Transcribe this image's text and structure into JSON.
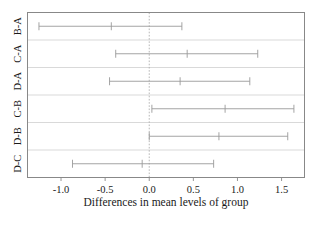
{
  "chart_data": {
    "type": "line",
    "title": "",
    "subtitle": "",
    "xlabel": "Differences in mean levels of group",
    "ylabel": "",
    "xlim": [
      -1.38,
      1.76
    ],
    "ylim": [
      0,
      6
    ],
    "grid": false,
    "legend": null,
    "reference_line": {
      "value": 0.0,
      "style": "dashed"
    },
    "orientation": "horizontal",
    "categories": [
      "B-A",
      "C-A",
      "D-A",
      "C-B",
      "D-B",
      "D-C"
    ],
    "series": [
      {
        "name": "difference",
        "values": [
          -0.43,
          0.43,
          0.35,
          0.86,
          0.79,
          -0.08
        ]
      },
      {
        "name": "lower",
        "values": [
          -1.25,
          -0.38,
          -0.45,
          0.03,
          0.0,
          -0.87
        ]
      },
      {
        "name": "upper",
        "values": [
          0.37,
          1.23,
          1.14,
          1.64,
          1.57,
          0.73
        ]
      }
    ],
    "intervals": [
      {
        "label": "B-A",
        "lower": -1.25,
        "diff": -0.43,
        "upper": 0.37
      },
      {
        "label": "C-A",
        "lower": -0.38,
        "diff": 0.43,
        "upper": 1.23
      },
      {
        "label": "D-A",
        "lower": -0.45,
        "diff": 0.35,
        "upper": 1.14
      },
      {
        "label": "C-B",
        "lower": 0.03,
        "diff": 0.86,
        "upper": 1.64
      },
      {
        "label": "D-B",
        "lower": 0.0,
        "diff": 0.79,
        "upper": 1.57
      },
      {
        "label": "D-C",
        "lower": -0.87,
        "diff": -0.08,
        "upper": 0.73
      }
    ],
    "xticks": [
      -1.0,
      -0.5,
      0.0,
      0.5,
      1.0,
      1.5
    ],
    "xticklabels": [
      "-1.0",
      "-0.5",
      "0.0",
      "0.5",
      "1.0",
      "1.5"
    ],
    "yticklabels": [
      "B-A",
      "C-A",
      "D-A",
      "C-B",
      "D-B",
      "D-C"
    ],
    "colors": {
      "line": "#9a9a9a",
      "frame": "#888888",
      "zero": "#b0b0b0",
      "text": "#1a1a1a"
    }
  },
  "axis": {
    "x_title": "Differences in mean levels of group"
  }
}
